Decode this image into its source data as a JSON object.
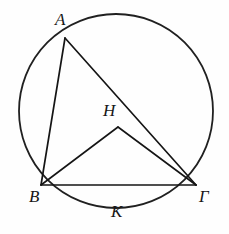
{
  "figure": {
    "background_color": "#fefefe",
    "stroke_color": "#1a1a1a",
    "width": 229,
    "height": 234
  },
  "circle": {
    "name": "circumscribed-circle",
    "center_x": 116,
    "center_y": 111,
    "radius": 97,
    "stroke_color": "#202020",
    "stroke_width": 1.8
  },
  "points": {
    "A": {
      "label": "A",
      "x": 65,
      "y": 38,
      "label_x": 55,
      "label_y": 11,
      "on_circle": true
    },
    "B": {
      "label": "B",
      "x": 41,
      "y": 185,
      "label_x": 29,
      "label_y": 188,
      "on_circle": true
    },
    "G": {
      "label": "Γ",
      "x": 196,
      "y": 185,
      "label_x": 199,
      "label_y": 188,
      "on_circle": true
    },
    "H": {
      "label": "H",
      "x": 118,
      "y": 127,
      "label_x": 103,
      "label_y": 102,
      "on_circle": false
    },
    "K": {
      "label": "K",
      "x": 118,
      "y": 208,
      "label_x": 111,
      "label_y": 203,
      "on_circle": true
    }
  },
  "segments": [
    {
      "name": "segment-A-B",
      "from": "A",
      "to": "B",
      "x1": 65,
      "y1": 38,
      "x2": 41,
      "y2": 185
    },
    {
      "name": "segment-A-Gamma",
      "from": "A",
      "to": "Γ",
      "x1": 65,
      "y1": 38,
      "x2": 196,
      "y2": 185
    },
    {
      "name": "segment-B-Gamma",
      "from": "B",
      "to": "Γ",
      "x1": 41,
      "y1": 185,
      "x2": 196,
      "y2": 185
    },
    {
      "name": "segment-B-H",
      "from": "B",
      "to": "H",
      "x1": 41,
      "y1": 185,
      "x2": 118,
      "y2": 127
    },
    {
      "name": "segment-H-Gamma",
      "from": "H",
      "to": "Γ",
      "x1": 118,
      "y1": 127,
      "x2": 196,
      "y2": 185
    }
  ],
  "labels": {
    "A": "A",
    "B": "B",
    "Gamma": "Γ",
    "H": "H",
    "K": "K"
  }
}
